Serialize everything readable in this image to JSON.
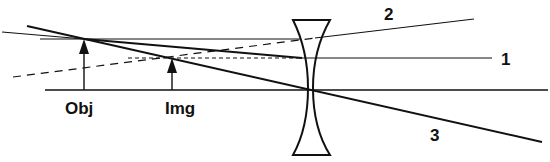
{
  "diagram": {
    "labels": {
      "object": "Obj",
      "image": "Img",
      "ray1": "1",
      "ray2": "2",
      "ray3": "3"
    },
    "colors": {
      "line": "#111111",
      "background": "#ffffff"
    },
    "elements": {
      "optical_axis": {
        "y": 90,
        "x1": 45,
        "x2": 548
      },
      "object_arrow": {
        "x": 84,
        "y_base": 90,
        "y_tip": 39
      },
      "image_arrow": {
        "x": 172,
        "y_base": 90,
        "y_tip": 58
      },
      "lens": {
        "type": "concave",
        "center_x": 311,
        "top_y": 20,
        "bottom_y": 155
      }
    }
  }
}
